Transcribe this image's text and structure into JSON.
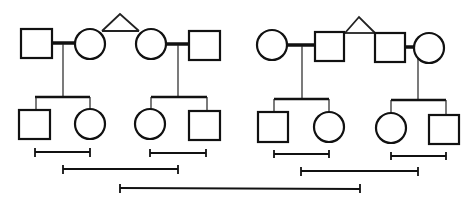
{
  "diagram": {
    "type": "pedigree",
    "colors": {
      "stroke": "#111111",
      "background": "#ffffff"
    },
    "families": [
      {
        "name": "left-family",
        "twins": [
          "female",
          "female"
        ],
        "couples": [
          {
            "spouse": "male",
            "twin": "female",
            "children": [
              "male",
              "female"
            ]
          },
          {
            "twin": "female",
            "spouse": "male",
            "children": [
              "female",
              "male"
            ]
          }
        ]
      },
      {
        "name": "right-family",
        "twins": [
          "male",
          "male"
        ],
        "couples": [
          {
            "spouse": "female",
            "twin": "male",
            "children": [
              "male",
              "female"
            ]
          },
          {
            "twin": "male",
            "spouse": "female",
            "children": [
              "female",
              "male"
            ]
          }
        ]
      }
    ],
    "brackets": [
      {
        "name": "left-family-sibs-1",
        "x1": 35,
        "x2": 90,
        "y": 152
      },
      {
        "name": "left-family-sibs-2",
        "x1": 150,
        "x2": 206,
        "y": 152
      },
      {
        "name": "left-family-cousins",
        "x1": 63,
        "x2": 178,
        "y": 169
      },
      {
        "name": "right-family-sibs-1",
        "x1": 274,
        "x2": 329,
        "y": 154
      },
      {
        "name": "right-family-sibs-2",
        "x1": 391,
        "x2": 446,
        "y": 156
      },
      {
        "name": "right-family-cousins",
        "x1": 301,
        "x2": 418,
        "y": 171
      },
      {
        "name": "between-families",
        "x1": 120,
        "x2": 360,
        "y": 188
      }
    ]
  }
}
